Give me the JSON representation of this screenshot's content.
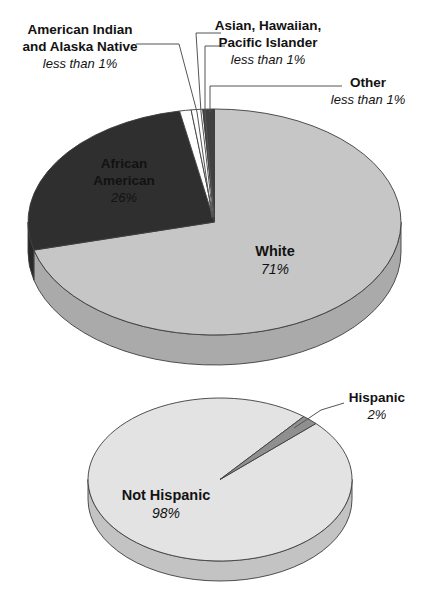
{
  "figure": {
    "background": "#ffffff",
    "outline_color": "#3d3d3d",
    "leader_line_color": "#555555"
  },
  "chart_data": [
    {
      "type": "pie",
      "id": "race",
      "style": "3d-ellipse",
      "start_angle_deg": -90,
      "direction": "clockwise",
      "legend_position": "callout-labels",
      "slices": [
        {
          "name": "White",
          "value": 71,
          "display_value": "71%",
          "color": "#c6c6c6"
        },
        {
          "name": "African American",
          "value": 26,
          "display_value": "26%",
          "color": "#2f2f2f"
        },
        {
          "name": "American Indian and Alaska Native",
          "value": 1,
          "display_value": "less than 1%",
          "color": "#ffffff"
        },
        {
          "name": "Asian, Hawaiian, Pacific Islander",
          "value": 1,
          "display_value": "less than 1%",
          "color": "#ffffff"
        },
        {
          "name": "Other",
          "value": 1,
          "display_value": "less than 1%",
          "color": "#404040"
        }
      ]
    },
    {
      "type": "pie",
      "id": "ethnicity",
      "style": "3d-ellipse",
      "start_angle_deg": -43.4,
      "direction": "clockwise",
      "legend_position": "callout-labels",
      "slices": [
        {
          "name": "Not Hispanic",
          "value": 98,
          "display_value": "98%",
          "color": "#e3e3e3"
        },
        {
          "name": "Hispanic",
          "value": 2,
          "display_value": "2%",
          "color": "#8f8f8f"
        }
      ]
    }
  ],
  "callouts": {
    "race": {
      "american_indian": {
        "lines": [
          "American Indian",
          "and Alaska Native"
        ],
        "note": "less than 1%"
      },
      "asian": {
        "lines": [
          "Asian, Hawaiian,",
          "Pacific Islander"
        ],
        "note": "less than 1%"
      },
      "other": {
        "lines": [
          "Other"
        ],
        "note": "less than 1%"
      },
      "african_american": {
        "lines": [
          "African",
          "American"
        ],
        "note": "26%"
      },
      "white": {
        "lines": [
          "White"
        ],
        "note": "71%"
      }
    },
    "ethnicity": {
      "hispanic": {
        "lines": [
          "Hispanic"
        ],
        "note": "2%"
      },
      "not_hispanic": {
        "lines": [
          "Not Hispanic"
        ],
        "note": "98%"
      }
    }
  }
}
